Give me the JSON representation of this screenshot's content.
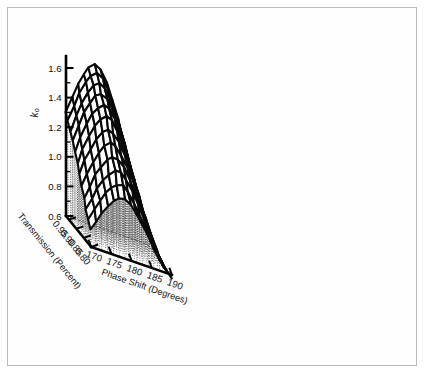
{
  "figure": {
    "background_color": "#ffffff",
    "border_color": "#b9b9b9",
    "line_color": "#0a0a0a"
  },
  "chart_data": {
    "type": "surface",
    "title": "",
    "subtitle": "",
    "projection": "3d-wireframe-mesh",
    "xlabel": "Phase Shift (Degrees)",
    "ylabel": "Transmission (Percent)",
    "zlabel": "k₀",
    "xlim": [
      170,
      190
    ],
    "ylim": [
      0.8,
      0.97
    ],
    "zlim": [
      0.6,
      1.7
    ],
    "xticks": [
      170,
      175,
      180,
      185,
      190
    ],
    "xticklabels": [
      "170",
      "175",
      "180",
      "185",
      "190"
    ],
    "yticks": [
      0.95,
      0.9,
      0.85,
      0.8
    ],
    "yticklabels": [
      "0.95",
      "0.90",
      "0.85",
      "0.80"
    ],
    "zticks": [
      0.6,
      0.8,
      1.0,
      1.2,
      1.4,
      1.6
    ],
    "zticklabels": [
      "0.6",
      "0.8",
      "1.0",
      "1.2",
      "1.4",
      "1.6"
    ],
    "z_minor_tick_step": 0.1,
    "grid": false,
    "legend": null,
    "x": [
      170,
      171.43,
      172.86,
      174.29,
      175.71,
      177.14,
      178.57,
      180,
      181.43,
      182.86,
      184.29,
      185.71,
      187.14,
      188.57,
      190
    ],
    "y": [
      0.97,
      0.955,
      0.94,
      0.925,
      0.91,
      0.895,
      0.88,
      0.865,
      0.85,
      0.835,
      0.82,
      0.805
    ],
    "z": [
      [
        1.3,
        1.42,
        1.52,
        1.6,
        1.66,
        1.69,
        1.67,
        1.6,
        1.5,
        1.38,
        1.24,
        1.1,
        0.96,
        0.83,
        0.72
      ],
      [
        1.26,
        1.38,
        1.48,
        1.56,
        1.62,
        1.65,
        1.63,
        1.56,
        1.46,
        1.34,
        1.21,
        1.07,
        0.93,
        0.8,
        0.7
      ],
      [
        1.21,
        1.33,
        1.43,
        1.51,
        1.57,
        1.6,
        1.58,
        1.52,
        1.42,
        1.3,
        1.17,
        1.03,
        0.9,
        0.78,
        0.68
      ],
      [
        1.16,
        1.28,
        1.38,
        1.46,
        1.52,
        1.55,
        1.53,
        1.47,
        1.37,
        1.26,
        1.13,
        1.0,
        0.87,
        0.76,
        0.66
      ],
      [
        1.11,
        1.22,
        1.32,
        1.4,
        1.46,
        1.49,
        1.48,
        1.42,
        1.32,
        1.21,
        1.09,
        0.96,
        0.84,
        0.73,
        0.64
      ],
      [
        1.05,
        1.16,
        1.26,
        1.34,
        1.4,
        1.43,
        1.42,
        1.36,
        1.27,
        1.16,
        1.05,
        0.93,
        0.81,
        0.71,
        0.63
      ],
      [
        0.99,
        1.1,
        1.19,
        1.27,
        1.33,
        1.36,
        1.35,
        1.3,
        1.22,
        1.11,
        1.0,
        0.89,
        0.79,
        0.69,
        0.61
      ],
      [
        0.93,
        1.03,
        1.12,
        1.2,
        1.26,
        1.29,
        1.28,
        1.23,
        1.16,
        1.06,
        0.96,
        0.86,
        0.76,
        0.67,
        0.6
      ],
      [
        0.87,
        0.96,
        1.05,
        1.12,
        1.18,
        1.21,
        1.21,
        1.17,
        1.1,
        1.01,
        0.92,
        0.82,
        0.74,
        0.66,
        0.59
      ],
      [
        0.81,
        0.9,
        0.98,
        1.05,
        1.1,
        1.14,
        1.14,
        1.1,
        1.04,
        0.96,
        0.88,
        0.79,
        0.71,
        0.64,
        0.58
      ],
      [
        0.76,
        0.84,
        0.91,
        0.98,
        1.03,
        1.06,
        1.07,
        1.04,
        0.98,
        0.91,
        0.84,
        0.76,
        0.69,
        0.63,
        0.58
      ],
      [
        0.71,
        0.78,
        0.85,
        0.91,
        0.96,
        0.99,
        1.0,
        0.97,
        0.92,
        0.86,
        0.8,
        0.73,
        0.67,
        0.62,
        0.57
      ]
    ],
    "style": {
      "mesh_stroke": "#0a0a0a",
      "mesh_fill": "#ffffff",
      "dropline_style": "dotted",
      "base_outline_style": "dashed"
    }
  }
}
